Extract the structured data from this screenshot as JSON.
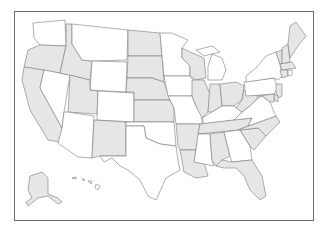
{
  "map": {
    "title": "United States map",
    "colors": {
      "shaded": "#e6e6e6",
      "unshaded": "#ffffff",
      "border": "#7a7a7a",
      "frame": "#6b6b6b"
    },
    "states": [
      {
        "id": "WA",
        "name": "Washington",
        "shaded": false,
        "d": "M33,23 L65,20 L66,46 L40,45 L34,38 Z"
      },
      {
        "id": "OR",
        "name": "Oregon",
        "shaded": true,
        "d": "M40,45 L66,46 L60,73 L24,67 L28,50 Z"
      },
      {
        "id": "CA",
        "name": "California",
        "shaded": true,
        "d": "M24,67 L44,70 L40,88 L62,128 L60,142 L48,140 L30,110 L22,80 Z"
      },
      {
        "id": "NV",
        "name": "Nevada",
        "shaded": false,
        "d": "M44,70 L70,75 L64,112 L62,128 L40,88 Z"
      },
      {
        "id": "ID",
        "name": "Idaho",
        "shaded": true,
        "d": "M66,24 L72,24 L72,44 L82,60 L92,61 L90,80 L60,73 L66,46 Z"
      },
      {
        "id": "MT",
        "name": "Montana",
        "shaded": false,
        "d": "M72,24 L128,30 L127,60 L92,61 L82,60 L72,44 Z"
      },
      {
        "id": "WY",
        "name": "Wyoming",
        "shaded": false,
        "d": "M92,61 L127,62 L126,92 L90,90 Z"
      },
      {
        "id": "UT",
        "name": "Utah",
        "shaded": true,
        "d": "M70,75 L90,80 L90,90 L98,91 L97,114 L68,112 Z"
      },
      {
        "id": "CO",
        "name": "Colorado",
        "shaded": false,
        "d": "M98,91 L134,93 L134,122 L97,120 Z"
      },
      {
        "id": "AZ",
        "name": "Arizona",
        "shaded": false,
        "d": "M68,112 L94,116 L92,158 L78,157 L58,143 L62,128 L64,112 Z"
      },
      {
        "id": "NM",
        "name": "New Mexico",
        "shaded": true,
        "d": "M94,120 L126,122 L126,156 L100,156 L92,158 Z"
      },
      {
        "id": "ND",
        "name": "North Dakota",
        "shaded": true,
        "d": "M128,30 L160,33 L162,56 L128,56 Z"
      },
      {
        "id": "SD",
        "name": "South Dakota",
        "shaded": true,
        "d": "M128,56 L162,56 L164,82 L152,78 L127,78 Z"
      },
      {
        "id": "NE",
        "name": "Nebraska",
        "shaded": true,
        "d": "M127,78 L152,78 L164,82 L170,100 L134,100 L134,92 L126,92 Z"
      },
      {
        "id": "KS",
        "name": "Kansas",
        "shaded": true,
        "d": "M134,100 L170,100 L174,108 L174,122 L134,122 Z"
      },
      {
        "id": "OK",
        "name": "Oklahoma",
        "shaded": false,
        "d": "M126,122 L174,122 L176,146 L160,144 L146,138 L144,126 L126,126 Z"
      },
      {
        "id": "TX",
        "name": "Texas",
        "shaded": false,
        "d": "M126,126 L144,126 L146,138 L160,144 L176,146 L178,160 L180,170 L166,178 L156,200 L148,196 L140,180 L128,170 L120,166 L112,158 L104,162 L100,156 L126,156 Z"
      },
      {
        "id": "MN",
        "name": "Minnesota",
        "shaded": false,
        "d": "M160,33 L172,33 L188,40 L182,48 L182,58 L190,66 L190,76 L164,76 L162,56 Z"
      },
      {
        "id": "IA",
        "name": "Iowa",
        "shaded": false,
        "d": "M164,76 L190,76 L196,84 L192,96 L168,96 Z"
      },
      {
        "id": "MO",
        "name": "Missouri",
        "shaded": false,
        "d": "M168,96 L192,96 L196,106 L202,114 L202,124 L176,124 L174,108 L170,100 Z"
      },
      {
        "id": "AR",
        "name": "Arkansas",
        "shaded": true,
        "d": "M176,124 L200,124 L198,138 L196,150 L180,150 L178,146 Z"
      },
      {
        "id": "LA",
        "name": "Louisiana",
        "shaded": true,
        "d": "M180,150 L196,150 L194,162 L204,162 L208,176 L196,178 L184,172 Z"
      },
      {
        "id": "WI",
        "name": "Wisconsin",
        "shaded": true,
        "d": "M182,48 L190,52 L204,58 L206,78 L196,80 L190,76 L190,66 L182,58 Z"
      },
      {
        "id": "IL",
        "name": "Illinois",
        "shaded": true,
        "d": "M192,80 L204,80 L210,94 L208,112 L202,118 L196,106 L192,96 Z"
      },
      {
        "id": "MI",
        "name": "Michigan",
        "shaded": false,
        "d": "M212,54 L222,58 L226,70 L222,80 L208,80 L208,66 Z M196,50 L212,46 L220,52 L204,56 Z"
      },
      {
        "id": "IN",
        "name": "Indiana",
        "shaded": true,
        "d": "M210,84 L220,84 L222,106 L212,112 L208,112 Z"
      },
      {
        "id": "OH",
        "name": "Ohio",
        "shaded": true,
        "d": "M220,84 L236,82 L244,86 L242,100 L234,106 L222,106 Z"
      },
      {
        "id": "KY",
        "name": "Kentucky",
        "shaded": false,
        "d": "M202,118 L212,112 L222,106 L234,106 L242,112 L234,120 L204,124 Z"
      },
      {
        "id": "TN",
        "name": "Tennessee",
        "shaded": true,
        "d": "M200,124 L234,120 L252,118 L248,126 L238,130 L198,134 Z"
      },
      {
        "id": "MS",
        "name": "Mississippi",
        "shaded": false,
        "d": "M198,134 L210,134 L212,160 L214,166 L204,164 L194,162 L196,150 Z"
      },
      {
        "id": "AL",
        "name": "Alabama",
        "shaded": true,
        "d": "M210,134 L224,132 L230,156 L222,160 L216,166 L212,160 Z"
      },
      {
        "id": "GA",
        "name": "Georgia",
        "shaded": false,
        "d": "M224,132 L240,130 L250,146 L252,160 L232,162 L230,156 Z"
      },
      {
        "id": "FL",
        "name": "Florida",
        "shaded": true,
        "d": "M216,166 L222,160 L232,162 L252,160 L262,176 L266,196 L260,200 L250,190 L244,176 L236,168 L224,168 Z"
      },
      {
        "id": "SC",
        "name": "South Carolina",
        "shaded": true,
        "d": "M240,130 L258,128 L266,136 L254,150 L250,146 Z"
      },
      {
        "id": "NC",
        "name": "North Carolina",
        "shaded": true,
        "d": "M248,126 L276,116 L280,122 L272,130 L266,136 L258,128 L240,130 L238,130 Z"
      },
      {
        "id": "VA",
        "name": "Virginia",
        "shaded": false,
        "d": "M242,112 L250,106 L256,100 L262,96 L270,102 L274,112 L276,116 L248,126 L252,118 L234,120 Z"
      },
      {
        "id": "WV",
        "name": "West Virginia",
        "shaded": true,
        "d": "M242,100 L244,90 L250,94 L258,96 L256,100 L250,106 L242,112 L236,108 Z"
      },
      {
        "id": "PA",
        "name": "Pennsylvania",
        "shaded": false,
        "d": "M244,82 L274,78 L278,88 L274,94 L246,96 Z"
      },
      {
        "id": "NY",
        "name": "New York",
        "shaded": false,
        "d": "M246,76 L256,68 L266,56 L276,52 L280,64 L282,76 L278,80 L274,78 L246,82 Z"
      },
      {
        "id": "NJ",
        "name": "New Jersey",
        "shaded": true,
        "d": "M276,84 L282,84 L282,96 L278,98 L276,92 Z"
      },
      {
        "id": "DE",
        "name": "Delaware",
        "shaded": true,
        "d": "M274,94 L278,96 L278,102 L274,100 Z"
      },
      {
        "id": "MD",
        "name": "Maryland",
        "shaded": true,
        "d": "M258,96 L274,94 L274,102 L270,102 L262,96 Z"
      },
      {
        "id": "VT",
        "name": "Vermont",
        "shaded": true,
        "d": "M276,52 L282,50 L282,64 L280,64 Z"
      },
      {
        "id": "NH",
        "name": "New Hampshire",
        "shaded": true,
        "d": "M282,48 L288,44 L290,62 L282,64 Z"
      },
      {
        "id": "ME",
        "name": "Maine",
        "shaded": true,
        "d": "M288,44 L290,26 L296,22 L306,36 L298,46 L290,58 Z"
      },
      {
        "id": "MA",
        "name": "Massachusetts",
        "shaded": true,
        "d": "M280,64 L292,62 L296,68 L282,70 Z"
      },
      {
        "id": "CT",
        "name": "Connecticut",
        "shaded": true,
        "d": "M280,70 L288,70 L288,76 L282,78 Z"
      },
      {
        "id": "RI",
        "name": "Rhode Island",
        "shaded": false,
        "d": "M288,70 L292,70 L292,75 L288,76 Z"
      },
      {
        "id": "AK",
        "name": "Alaska",
        "shaded": true,
        "d": "M30,176 L42,172 L48,178 L48,194 L58,198 L62,202 L58,204 L48,196 L38,198 L28,206 L26,202 L32,198 L28,190 Z"
      },
      {
        "id": "HI",
        "name": "Hawaii",
        "shaded": false,
        "d": "M72,178 L76,177 L76,179 Z M82,179 L84,179 L84,181 Z M88,181 L92,181 L91,184 Z M96,184 L100,186 L98,190 L95,188 Z"
      }
    ]
  }
}
